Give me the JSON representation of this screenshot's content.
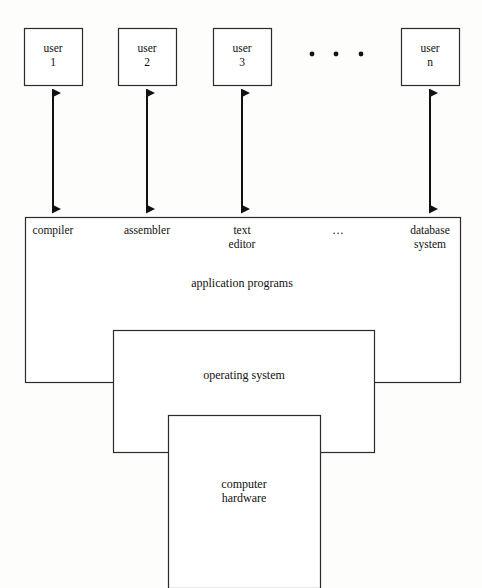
{
  "diagram": {
    "users": [
      {
        "name": "user-1",
        "label": "user\n1",
        "x": 24,
        "y": 28,
        "w": 58,
        "h": 57
      },
      {
        "name": "user-2",
        "label": "user\n2",
        "x": 118,
        "y": 28,
        "w": 58,
        "h": 57
      },
      {
        "name": "user-3",
        "label": "user\n3",
        "x": 213,
        "y": 28,
        "w": 58,
        "h": 57
      },
      {
        "name": "user-n",
        "label": "user\nn",
        "x": 401,
        "y": 28,
        "w": 58,
        "h": 57
      }
    ],
    "users_ellipsis": {
      "label": "•   •   •",
      "dots": [
        {
          "cx": 312,
          "cy": 54
        },
        {
          "cx": 336,
          "cy": 54
        },
        {
          "cx": 361,
          "cy": 54
        }
      ]
    },
    "arrows": [
      {
        "name": "arrow-user-1-to-compiler",
        "x": 53,
        "y1": 86,
        "y2": 216
      },
      {
        "name": "arrow-user-2-to-assembler",
        "x": 147,
        "y1": 86,
        "y2": 216
      },
      {
        "name": "arrow-user-3-to-text-editor",
        "x": 242,
        "y1": 86,
        "y2": 216
      },
      {
        "name": "arrow-user-n-to-database-system",
        "x": 430,
        "y1": 86,
        "y2": 216
      }
    ],
    "application_box": {
      "name": "application-programs-box",
      "x": 25,
      "y": 217,
      "w": 435,
      "h": 165,
      "label": "application programs",
      "label_x": 182,
      "label_y": 276,
      "services": [
        {
          "name": "compiler",
          "label": "compiler",
          "cx": 53,
          "y": 224
        },
        {
          "name": "assembler",
          "label": "assembler",
          "cx": 147,
          "y": 224
        },
        {
          "name": "text-editor",
          "label": "text\neditor",
          "cx": 242,
          "y": 224
        },
        {
          "name": "services-ellipsis",
          "label": "…",
          "cx": 338,
          "y": 224
        },
        {
          "name": "database-system",
          "label": "database\nsystem",
          "cx": 430,
          "y": 224
        }
      ]
    },
    "operating_system_box": {
      "name": "operating-system-box",
      "x": 113,
      "y": 330,
      "w": 261,
      "h": 122,
      "label": "operating system",
      "label_x": 144,
      "label_y": 368
    },
    "hardware_box": {
      "name": "computer-hardware-box",
      "x": 168,
      "y": 415,
      "w": 152,
      "h": 173,
      "label": "computer\nhardware",
      "label_x": 144,
      "label_y": 477
    },
    "colors": {
      "background": "#fdfdfc",
      "stroke": "#2b2b2b",
      "arrow": "#111111",
      "text": "#111111"
    }
  }
}
